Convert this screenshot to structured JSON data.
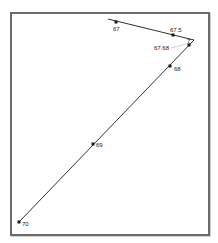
{
  "figure": {
    "frame": {
      "x": 10,
      "y": 12,
      "width": 200,
      "height": 224,
      "border_color": "#6b6b6b"
    },
    "line_color": "#1a1a1a",
    "leader_color": "#c8c8c8",
    "path_points": [
      {
        "x": 108,
        "y": 19
      },
      {
        "x": 194,
        "y": 40
      },
      {
        "x": 19,
        "y": 222
      }
    ],
    "markers": [
      {
        "id": "p67",
        "x": 116,
        "y": 22,
        "label": "67",
        "lx": 113,
        "ly": 31
      },
      {
        "id": "p67_5",
        "x": 173,
        "y": 35,
        "label": "67.5",
        "lx": 170,
        "ly": 32
      },
      {
        "id": "p67_9",
        "x": 189,
        "y": 45,
        "label": "7",
        "lx": 187,
        "ly": 43
      },
      {
        "id": "p68",
        "x": 170,
        "y": 66,
        "label": "68",
        "lx": 174,
        "ly": 71
      },
      {
        "id": "p69",
        "x": 93,
        "y": 144,
        "label": "69",
        "lx": 96,
        "ly": 147
      },
      {
        "id": "p70",
        "x": 19,
        "y": 222,
        "label": "70",
        "lx": 22,
        "ly": 226
      }
    ],
    "callout": {
      "label": "67.68",
      "lx": 154,
      "ly": 50,
      "x1": 171,
      "y1": 48,
      "x2": 190,
      "y2": 43
    }
  },
  "chart_data": {
    "type": "line",
    "title": "",
    "xlabel": "",
    "ylabel": "",
    "grid": false,
    "legend": null,
    "annotations": [
      "67",
      "67.5",
      "67.68",
      "7",
      "68",
      "69",
      "70"
    ],
    "series": [
      {
        "name": "path",
        "points": [
          {
            "x": 108,
            "y": 19,
            "label": ""
          },
          {
            "x": 116,
            "y": 22,
            "label": "67"
          },
          {
            "x": 173,
            "y": 35,
            "label": "67.5"
          },
          {
            "x": 194,
            "y": 40,
            "label": ""
          },
          {
            "x": 189,
            "y": 45,
            "label": "7"
          },
          {
            "x": 170,
            "y": 66,
            "label": "68"
          },
          {
            "x": 93,
            "y": 144,
            "label": "69"
          },
          {
            "x": 19,
            "y": 222,
            "label": "70"
          }
        ]
      }
    ]
  }
}
